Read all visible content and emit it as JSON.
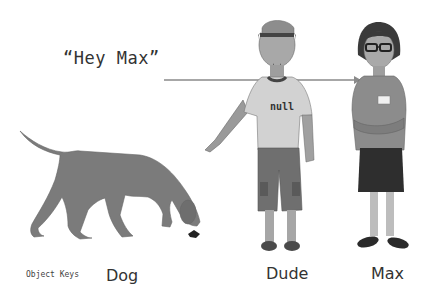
{
  "quote": "“Hey Max”",
  "labels": {
    "legend": "Object Keys",
    "dog": "Dog",
    "dude": "Dude",
    "max": "Max"
  },
  "shirt_text": "null",
  "tag_text": "MAX",
  "colors": {
    "figure_gray": "#7a7a7a",
    "arrow": "#888888",
    "text": "#333333"
  }
}
